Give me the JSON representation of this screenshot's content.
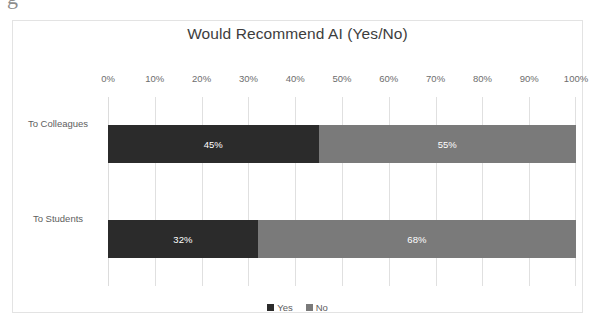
{
  "clipped_text_above": "g",
  "chart_data": {
    "type": "bar",
    "orientation": "horizontal",
    "stacked": true,
    "stacked_mode": "percent",
    "title": "Would Recommend AI (Yes/No)",
    "xlabel": "",
    "ylabel": "",
    "xlim": [
      0,
      100
    ],
    "x_tick_labels": [
      "0%",
      "10%",
      "20%",
      "30%",
      "40%",
      "50%",
      "60%",
      "70%",
      "80%",
      "90%",
      "100%"
    ],
    "x_tick_values": [
      0,
      10,
      20,
      30,
      40,
      50,
      60,
      70,
      80,
      90,
      100
    ],
    "grid": true,
    "grid_axis": "x",
    "legend_position": "bottom",
    "categories": [
      "To Colleagues",
      "To Students"
    ],
    "series": [
      {
        "name": "Yes",
        "color": "#2b2b2b",
        "values": [
          45,
          32
        ],
        "labels": [
          "45%",
          "68%"
        ]
      },
      {
        "name": "No",
        "color": "#7a7a7a",
        "values": [
          55,
          68
        ],
        "labels": [
          "55%",
          "68%"
        ]
      }
    ],
    "bars": [
      {
        "category": "To Colleagues",
        "segments": [
          {
            "series": "Yes",
            "value": 45,
            "label": "45%",
            "color": "#2b2b2b"
          },
          {
            "series": "No",
            "value": 55,
            "label": "55%",
            "color": "#7a7a7a"
          }
        ]
      },
      {
        "category": "To Students",
        "segments": [
          {
            "series": "Yes",
            "value": 32,
            "label": "32%",
            "color": "#2b2b2b"
          },
          {
            "series": "No",
            "value": 68,
            "label": "68%",
            "color": "#7a7a7a"
          }
        ]
      }
    ]
  },
  "legend": {
    "items": [
      {
        "label": "Yes",
        "color": "#2b2b2b"
      },
      {
        "label": "No",
        "color": "#7a7a7a"
      }
    ]
  }
}
